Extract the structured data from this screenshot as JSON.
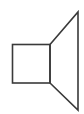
{
  "figure": {
    "canvas": {
      "width": 84,
      "height": 114,
      "background_color": "#ffffff"
    },
    "stroke": {
      "color": "#3a3a3a",
      "width": 1.6,
      "linejoin": "miter",
      "linecap": "butt",
      "fill": "none"
    },
    "shapes": [
      {
        "name": "speaker-body-square",
        "type": "rect",
        "x": 12.5,
        "y": 44.5,
        "width": 37.5,
        "height": 38.5,
        "fill": "none"
      },
      {
        "name": "speaker-horn-cone",
        "type": "polygon",
        "points": "50,44.5 78,12 78,110 50,83",
        "fill": "none"
      }
    ]
  }
}
